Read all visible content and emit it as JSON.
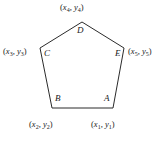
{
  "figure": {
    "type": "labeled-pentagon-diagram",
    "width": 165,
    "height": 141,
    "background_color": "#ffffff",
    "stroke_color": "#2b2b2b",
    "stroke_width": 1,
    "text_color": "#1a1a1a"
  },
  "shape": {
    "name": "pentagon",
    "sides": 5,
    "closed": true,
    "filled": false,
    "path_points": "113,108 124,48 82,22 40,48 52,108"
  },
  "vertices": [
    {
      "id": "A",
      "letter": "A",
      "coord_label": "(x1, y1)",
      "x_var": "x",
      "y_var": "y",
      "subscript": "1",
      "point_x": 113,
      "point_y": 108,
      "letter_x": 104,
      "letter_y": 94,
      "label_x": 91,
      "label_y": 120
    },
    {
      "id": "B",
      "letter": "B",
      "coord_label": "(x2, y2)",
      "x_var": "x",
      "y_var": "y",
      "subscript": "2",
      "point_x": 52,
      "point_y": 108,
      "letter_x": 55,
      "letter_y": 94,
      "label_x": 29,
      "label_y": 120
    },
    {
      "id": "C",
      "letter": "C",
      "coord_label": "(x3, y3)",
      "x_var": "x",
      "y_var": "y",
      "subscript": "3",
      "point_x": 40,
      "point_y": 48,
      "letter_x": 44,
      "letter_y": 49,
      "label_x": 3,
      "label_y": 47
    },
    {
      "id": "D",
      "letter": "D",
      "coord_label": "(x4, y4)",
      "x_var": "x",
      "y_var": "y",
      "subscript": "4",
      "point_x": 82,
      "point_y": 22,
      "letter_x": 77,
      "letter_y": 26,
      "label_x": 60,
      "label_y": 3
    },
    {
      "id": "E",
      "letter": "E",
      "coord_label": "(x5, y5)",
      "x_var": "x",
      "y_var": "y",
      "subscript": "5",
      "point_x": 124,
      "point_y": 48,
      "letter_x": 115,
      "letter_y": 49,
      "label_x": 128,
      "label_y": 47
    }
  ],
  "edges": [
    {
      "from": "A",
      "to": "B"
    },
    {
      "from": "B",
      "to": "C"
    },
    {
      "from": "C",
      "to": "D"
    },
    {
      "from": "D",
      "to": "E"
    },
    {
      "from": "E",
      "to": "A"
    }
  ]
}
